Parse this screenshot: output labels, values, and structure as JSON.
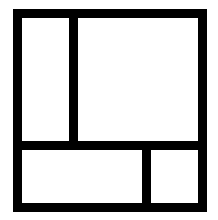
{
  "diagram": {
    "stroke_color": "#000000",
    "background_color": "#ffffff",
    "stroke_width": 9,
    "outer_frame": {
      "left": 13,
      "top": 9,
      "right": 207,
      "bottom": 212
    },
    "dividers": [
      {
        "name": "top-left-vertical-divider",
        "x": 69,
        "y": 9,
        "w": 9,
        "h": 141
      },
      {
        "name": "horizontal-divider",
        "x": 13,
        "y": 141,
        "w": 194,
        "h": 9
      },
      {
        "name": "bottom-right-vertical-divider",
        "x": 142,
        "y": 141,
        "w": 9,
        "h": 71
      }
    ],
    "regions": [
      {
        "name": "top-left-panel"
      },
      {
        "name": "top-right-panel"
      },
      {
        "name": "bottom-left-panel"
      },
      {
        "name": "bottom-right-panel"
      }
    ]
  }
}
